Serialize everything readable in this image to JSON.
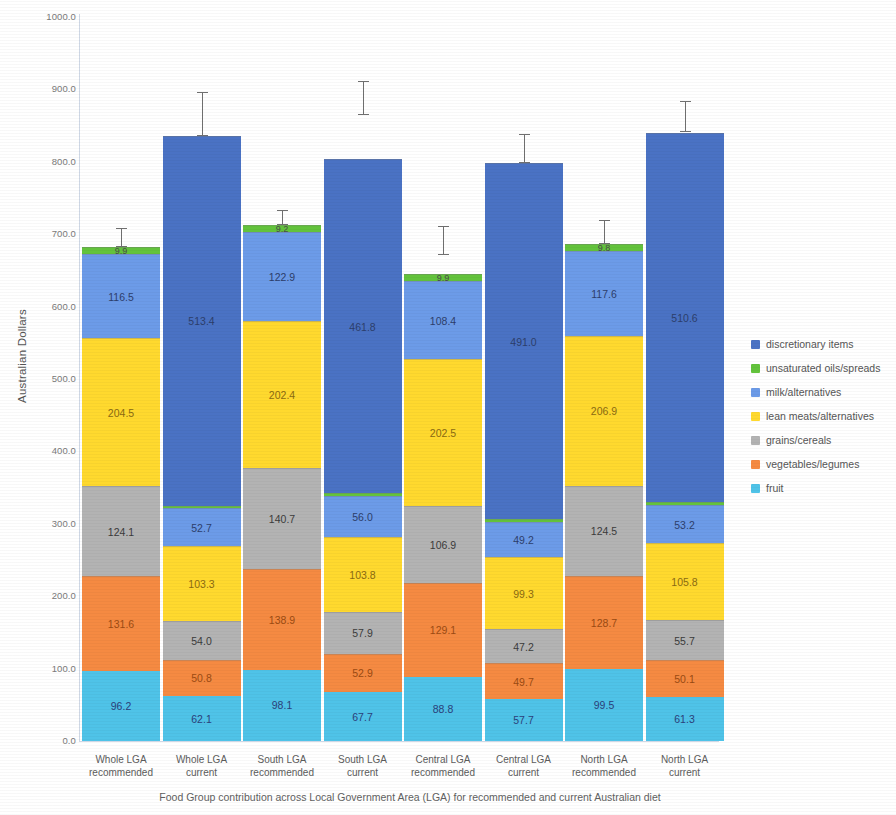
{
  "chart_data": {
    "type": "bar",
    "subtype": "stacked",
    "title": "",
    "xlabel": "Food Group contribution across Local Government Area (LGA) for recommended and current Australian diet",
    "ylabel": "Australian Dollars",
    "ylim": [
      0,
      1000
    ],
    "ytick_labels": [
      "1000.0",
      "900.0",
      "800.0",
      "700.0",
      "600.0",
      "500.0",
      "400.0",
      "300.0",
      "200.0",
      "100.0",
      "0.0"
    ],
    "ytick_values": [
      1000,
      900,
      800,
      700,
      600,
      500,
      400,
      300,
      200,
      100,
      0
    ],
    "grid": false,
    "legend_position": "right",
    "categories": [
      "Whole LGA recommended",
      "Whole LGA current",
      "South LGA recommended",
      "South LGA current",
      "Central LGA recommended",
      "Central LGA current",
      "North LGA recommended",
      "North LGA current"
    ],
    "category_lines": [
      [
        "Whole LGA",
        "recommended"
      ],
      [
        "Whole LGA",
        "current"
      ],
      [
        "South LGA",
        "recommended"
      ],
      [
        "South LGA",
        "current"
      ],
      [
        "Central LGA",
        "recommended"
      ],
      [
        "Central LGA",
        "current"
      ],
      [
        "North LGA",
        "recommended"
      ],
      [
        "North LGA",
        "current"
      ]
    ],
    "series": [
      {
        "name": "fruit",
        "color": "#4FC3E8",
        "values": [
          96.2,
          62.1,
          98.1,
          67.7,
          88.8,
          57.7,
          99.5,
          61.3
        ],
        "labels": [
          "96.2",
          "62.1",
          "98.1",
          "67.7",
          "88.8",
          "57.7",
          "99.5",
          "61.3"
        ]
      },
      {
        "name": "vegetables/legumes",
        "color": "#F58A42",
        "values": [
          131.6,
          50.8,
          138.9,
          52.9,
          129.1,
          49.7,
          128.7,
          50.1
        ],
        "labels": [
          "131.6",
          "50.8",
          "138.9",
          "52.9",
          "129.1",
          "49.7",
          "128.7",
          "50.1"
        ]
      },
      {
        "name": "grains/cereals",
        "color": "#B3B3B3",
        "values": [
          124.1,
          54.0,
          140.7,
          57.9,
          106.9,
          47.2,
          124.5,
          55.7
        ],
        "labels": [
          "124.1",
          "54.0",
          "140.7",
          "57.9",
          "106.9",
          "47.2",
          "124.5",
          "55.7"
        ]
      },
      {
        "name": "lean meats/alternatives",
        "color": "#FFD92E",
        "values": [
          204.5,
          103.3,
          202.4,
          103.8,
          202.5,
          99.3,
          206.9,
          105.8
        ],
        "labels": [
          "204.5",
          "103.3",
          "202.4",
          "103.8",
          "202.5",
          "99.3",
          "206.9",
          "105.8"
        ]
      },
      {
        "name": "milk/alternatives",
        "color": "#6C9BE8",
        "values": [
          116.5,
          52.7,
          122.9,
          56.0,
          108.4,
          49.2,
          117.6,
          53.2
        ],
        "labels": [
          "116.5",
          "52.7",
          "122.9",
          "56.0",
          "108.4",
          "49.2",
          "117.6",
          "53.2"
        ]
      },
      {
        "name": "unsaturated oils/spreads",
        "color": "#63C33C",
        "values": [
          9.9,
          3.9,
          9.2,
          3.8,
          9.9,
          3.8,
          9.8,
          3.8
        ],
        "labels": [
          "9.9",
          "",
          "9.2",
          "",
          "9.9",
          "",
          "9.8",
          ""
        ]
      },
      {
        "name": "discretionary items",
        "color": "#4A72C4",
        "values": [
          0.0,
          513.4,
          0.0,
          461.8,
          0.0,
          491.0,
          0.0,
          510.6
        ],
        "labels": [
          "",
          "513.4",
          "",
          "461.8",
          "",
          "491.0",
          "",
          "510.6"
        ]
      }
    ],
    "totals": [
      682.8,
      836.3,
      712.2,
      803.9,
      645.6,
      797.9,
      687.0,
      840.5
    ],
    "error_bars": [
      {
        "center": 682.8,
        "low": 660.0,
        "high": 709.0
      },
      {
        "center": 836.3,
        "low": 826.0,
        "high": 897.0
      },
      {
        "center": 712.2,
        "low": 700.0,
        "high": 733.0
      },
      {
        "center": 803.9,
        "low": 865.0,
        "high": 912.0
      },
      {
        "center": 645.6,
        "low": 671.0,
        "high": 712.0
      },
      {
        "center": 797.9,
        "low": 796.0,
        "high": 838.0
      },
      {
        "center": 687.0,
        "low": 677.0,
        "high": 720.0
      },
      {
        "center": 840.5,
        "low": 829.0,
        "high": 884.0
      }
    ]
  },
  "legend": {
    "entries": [
      {
        "label": "discretionary items",
        "color": "#4A72C4"
      },
      {
        "label": "unsaturated oils/spreads",
        "color": "#63C33C"
      },
      {
        "label": "milk/alternatives",
        "color": "#6C9BE8"
      },
      {
        "label": "lean meats/alternatives",
        "color": "#FFD92E"
      },
      {
        "label": "grains/cereals",
        "color": "#B3B3B3"
      },
      {
        "label": "vegetables/legumes",
        "color": "#F58A42"
      },
      {
        "label": "fruit",
        "color": "#4FC3E8"
      }
    ]
  }
}
